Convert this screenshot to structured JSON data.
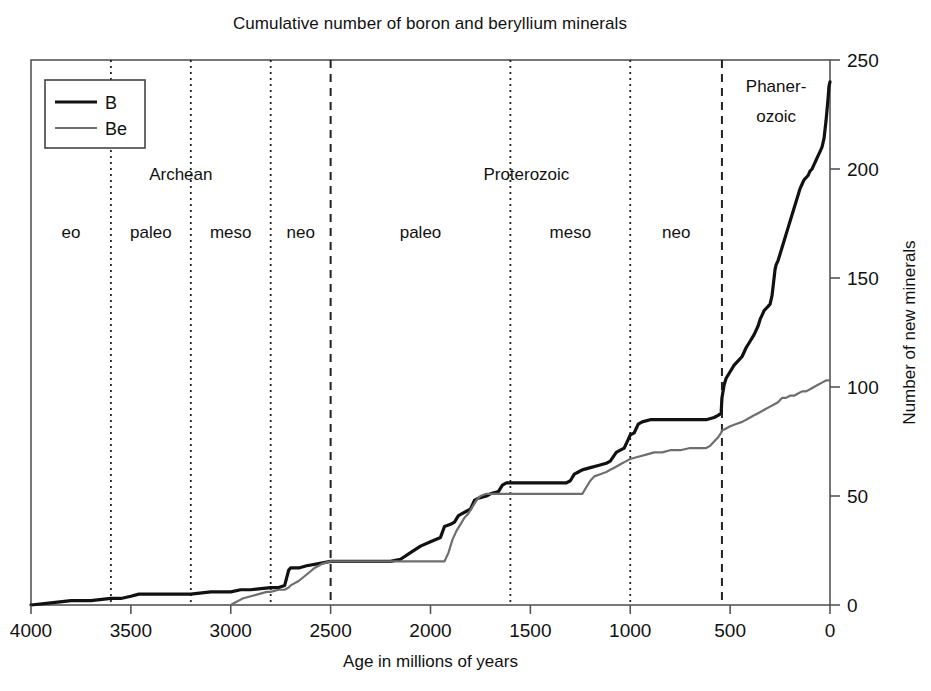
{
  "chart_data": {
    "type": "line",
    "title": "Cumulative number of boron and beryllium minerals",
    "xlabel": "Age in millions of years",
    "ylabel": "Number of new minerals",
    "xlim": [
      4000,
      0
    ],
    "ylim": [
      0,
      250
    ],
    "x_reversed": true,
    "grid": false,
    "legend_position": "top-left",
    "xticks": [
      4000,
      3500,
      3000,
      2500,
      2000,
      1500,
      1000,
      500,
      0
    ],
    "xtick_labels": [
      "4000",
      "3500",
      "3000",
      "2500",
      "2000",
      "1500",
      "1000",
      "500",
      "0"
    ],
    "yticks": [
      0,
      50,
      100,
      150,
      200,
      250
    ],
    "ytick_labels": [
      "0",
      "50",
      "100",
      "150",
      "200",
      "250"
    ],
    "series": [
      {
        "name": "B",
        "legend_label": "B",
        "color": "#111111",
        "width": 3.2,
        "points": [
          [
            4000,
            0
          ],
          [
            3900,
            1
          ],
          [
            3800,
            2
          ],
          [
            3700,
            2
          ],
          [
            3600,
            3
          ],
          [
            3550,
            3
          ],
          [
            3500,
            4
          ],
          [
            3460,
            5
          ],
          [
            3400,
            5
          ],
          [
            3300,
            5
          ],
          [
            3200,
            5
          ],
          [
            3100,
            6
          ],
          [
            3000,
            6
          ],
          [
            2950,
            7
          ],
          [
            2900,
            7
          ],
          [
            2800,
            8
          ],
          [
            2760,
            8
          ],
          [
            2730,
            9
          ],
          [
            2710,
            16
          ],
          [
            2700,
            17
          ],
          [
            2660,
            17
          ],
          [
            2620,
            18
          ],
          [
            2560,
            19
          ],
          [
            2500,
            20
          ],
          [
            2450,
            20
          ],
          [
            2300,
            20
          ],
          [
            2200,
            20
          ],
          [
            2150,
            21
          ],
          [
            2100,
            24
          ],
          [
            2050,
            27
          ],
          [
            2000,
            29
          ],
          [
            1950,
            31
          ],
          [
            1930,
            36
          ],
          [
            1900,
            37
          ],
          [
            1880,
            38
          ],
          [
            1860,
            41
          ],
          [
            1840,
            42
          ],
          [
            1820,
            43
          ],
          [
            1800,
            44
          ],
          [
            1780,
            48
          ],
          [
            1760,
            49
          ],
          [
            1720,
            50
          ],
          [
            1700,
            51
          ],
          [
            1660,
            52
          ],
          [
            1640,
            55
          ],
          [
            1620,
            56
          ],
          [
            1600,
            56
          ],
          [
            1560,
            56
          ],
          [
            1500,
            56
          ],
          [
            1400,
            56
          ],
          [
            1320,
            56
          ],
          [
            1300,
            57
          ],
          [
            1280,
            60
          ],
          [
            1260,
            61
          ],
          [
            1240,
            62
          ],
          [
            1200,
            63
          ],
          [
            1160,
            64
          ],
          [
            1120,
            65
          ],
          [
            1100,
            66
          ],
          [
            1070,
            70
          ],
          [
            1050,
            71
          ],
          [
            1030,
            72
          ],
          [
            1010,
            76
          ],
          [
            1000,
            78
          ],
          [
            980,
            79
          ],
          [
            960,
            83
          ],
          [
            940,
            84
          ],
          [
            900,
            85
          ],
          [
            850,
            85
          ],
          [
            800,
            85
          ],
          [
            700,
            85
          ],
          [
            620,
            85
          ],
          [
            580,
            86
          ],
          [
            560,
            87
          ],
          [
            545,
            88
          ],
          [
            541,
            95
          ],
          [
            530,
            101
          ],
          [
            520,
            104
          ],
          [
            500,
            107
          ],
          [
            480,
            110
          ],
          [
            460,
            112
          ],
          [
            440,
            114
          ],
          [
            420,
            118
          ],
          [
            400,
            121
          ],
          [
            380,
            124
          ],
          [
            360,
            128
          ],
          [
            350,
            131
          ],
          [
            340,
            133
          ],
          [
            330,
            135
          ],
          [
            320,
            136
          ],
          [
            310,
            137
          ],
          [
            300,
            138
          ],
          [
            290,
            142
          ],
          [
            280,
            150
          ],
          [
            275,
            154
          ],
          [
            270,
            156
          ],
          [
            260,
            158
          ],
          [
            250,
            161
          ],
          [
            240,
            164
          ],
          [
            230,
            167
          ],
          [
            220,
            170
          ],
          [
            210,
            173
          ],
          [
            200,
            176
          ],
          [
            190,
            179
          ],
          [
            180,
            182
          ],
          [
            170,
            185
          ],
          [
            160,
            188
          ],
          [
            150,
            191
          ],
          [
            140,
            193
          ],
          [
            130,
            195
          ],
          [
            120,
            196
          ],
          [
            110,
            197
          ],
          [
            100,
            199
          ],
          [
            90,
            200
          ],
          [
            80,
            202
          ],
          [
            70,
            204
          ],
          [
            60,
            206
          ],
          [
            50,
            208
          ],
          [
            40,
            210
          ],
          [
            30,
            214
          ],
          [
            20,
            222
          ],
          [
            10,
            232
          ],
          [
            5,
            238
          ],
          [
            0,
            240
          ]
        ]
      },
      {
        "name": "Be",
        "legend_label": "Be",
        "color": "#6e6e6e",
        "width": 2.2,
        "points": [
          [
            3000,
            0
          ],
          [
            2980,
            1
          ],
          [
            2960,
            2
          ],
          [
            2940,
            3
          ],
          [
            2900,
            4
          ],
          [
            2860,
            5
          ],
          [
            2820,
            6
          ],
          [
            2800,
            6
          ],
          [
            2760,
            7
          ],
          [
            2730,
            7
          ],
          [
            2710,
            8
          ],
          [
            2700,
            9
          ],
          [
            2660,
            11
          ],
          [
            2620,
            14
          ],
          [
            2580,
            17
          ],
          [
            2540,
            19
          ],
          [
            2500,
            20
          ],
          [
            2400,
            20
          ],
          [
            2300,
            20
          ],
          [
            2200,
            20
          ],
          [
            2100,
            20
          ],
          [
            2000,
            20
          ],
          [
            1950,
            20
          ],
          [
            1930,
            20
          ],
          [
            1910,
            24
          ],
          [
            1890,
            30
          ],
          [
            1870,
            34
          ],
          [
            1850,
            37
          ],
          [
            1830,
            40
          ],
          [
            1810,
            42
          ],
          [
            1790,
            45
          ],
          [
            1770,
            48
          ],
          [
            1750,
            50
          ],
          [
            1720,
            51
          ],
          [
            1700,
            51
          ],
          [
            1660,
            51
          ],
          [
            1600,
            51
          ],
          [
            1500,
            51
          ],
          [
            1400,
            51
          ],
          [
            1300,
            51
          ],
          [
            1240,
            51
          ],
          [
            1220,
            54
          ],
          [
            1200,
            57
          ],
          [
            1180,
            59
          ],
          [
            1150,
            60
          ],
          [
            1120,
            61
          ],
          [
            1100,
            62
          ],
          [
            1080,
            63
          ],
          [
            1060,
            64
          ],
          [
            1040,
            65
          ],
          [
            1020,
            66
          ],
          [
            1000,
            67
          ],
          [
            960,
            68
          ],
          [
            920,
            69
          ],
          [
            880,
            70
          ],
          [
            840,
            70
          ],
          [
            800,
            71
          ],
          [
            750,
            71
          ],
          [
            700,
            72
          ],
          [
            660,
            72
          ],
          [
            620,
            72
          ],
          [
            600,
            73
          ],
          [
            580,
            75
          ],
          [
            560,
            77
          ],
          [
            545,
            79
          ],
          [
            541,
            80
          ],
          [
            520,
            81
          ],
          [
            500,
            82
          ],
          [
            470,
            83
          ],
          [
            440,
            84
          ],
          [
            420,
            85
          ],
          [
            400,
            86
          ],
          [
            380,
            87
          ],
          [
            360,
            88
          ],
          [
            340,
            89
          ],
          [
            320,
            90
          ],
          [
            300,
            91
          ],
          [
            280,
            92
          ],
          [
            260,
            93
          ],
          [
            250,
            94
          ],
          [
            240,
            95
          ],
          [
            220,
            95
          ],
          [
            200,
            96
          ],
          [
            180,
            96
          ],
          [
            160,
            97
          ],
          [
            140,
            98
          ],
          [
            120,
            98
          ],
          [
            100,
            99
          ],
          [
            80,
            100
          ],
          [
            60,
            101
          ],
          [
            40,
            102
          ],
          [
            20,
            103
          ],
          [
            0,
            103
          ]
        ]
      }
    ],
    "era_bands": [
      {
        "label": "Archean",
        "start": 4000,
        "end": 2500,
        "center": 3250,
        "style": "dashed"
      },
      {
        "label": "Proterozoic",
        "start": 2500,
        "end": 541,
        "center": 1520,
        "style": "dashed"
      },
      {
        "label": "Phaner-\nozoic",
        "line1": "Phaner-",
        "line2": "ozoic",
        "start": 541,
        "end": 0,
        "center": 270,
        "style": "dashed"
      }
    ],
    "sub_bands": [
      {
        "label": "eo",
        "start": 4000,
        "end": 3600,
        "center": 3800
      },
      {
        "label": "paleo",
        "start": 3600,
        "end": 3200,
        "center": 3400
      },
      {
        "label": "meso",
        "start": 3200,
        "end": 2800,
        "center": 3000
      },
      {
        "label": "neo",
        "start": 2800,
        "end": 2500,
        "center": 2650
      },
      {
        "label": "paleo",
        "start": 2500,
        "end": 1600,
        "center": 2050
      },
      {
        "label": "meso",
        "start": 1600,
        "end": 1000,
        "center": 1300
      },
      {
        "label": "neo",
        "start": 1000,
        "end": 541,
        "center": 770
      }
    ],
    "major_dividers": [
      2500,
      541
    ],
    "minor_dividers": [
      3600,
      3200,
      2800,
      1600,
      1000
    ]
  },
  "colors": {
    "boron_line": "#111111",
    "beryllium_line": "#6e6e6e",
    "axis": "#555555",
    "background": "#ffffff",
    "text": "#111111"
  }
}
